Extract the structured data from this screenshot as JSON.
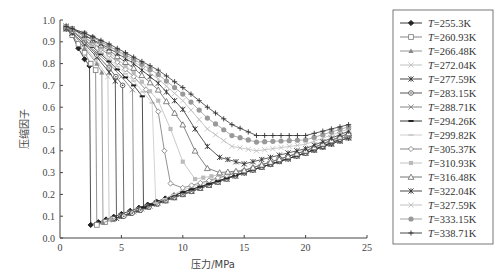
{
  "chart_data": {
    "type": "line",
    "title": "",
    "xlabel": "压力/MPa",
    "ylabel": "压缩因子",
    "xlim": [
      0,
      25
    ],
    "ylim": [
      0.0,
      1.0
    ],
    "xticks": [
      "0",
      "5",
      "10",
      "15",
      "20",
      "25"
    ],
    "yticks": [
      "0.0",
      "0.1",
      "0.2",
      "0.3",
      "0.4",
      "0.5",
      "0.6",
      "0.7",
      "0.8",
      "0.9",
      "1.0"
    ],
    "grid": false,
    "legend_position": "right-outside",
    "series": [
      {
        "name": "T=255.3K",
        "marker": "diamond-filled",
        "color": "#222222",
        "x": [
          0.5,
          1.0,
          1.5,
          2.0,
          2.4,
          2.5,
          5,
          10,
          15,
          20,
          23.5
        ],
        "y": [
          0.96,
          0.93,
          0.87,
          0.82,
          0.79,
          0.06,
          0.11,
          0.21,
          0.3,
          0.39,
          0.46
        ]
      },
      {
        "name": "T=260.93K",
        "marker": "square-open",
        "color": "#777777",
        "x": [
          0.5,
          1.0,
          1.5,
          2.0,
          2.5,
          2.9,
          3.0,
          5,
          10,
          15,
          20,
          23.5
        ],
        "y": [
          0.96,
          0.93,
          0.89,
          0.85,
          0.8,
          0.77,
          0.06,
          0.1,
          0.2,
          0.3,
          0.39,
          0.46
        ]
      },
      {
        "name": "T=266.48K",
        "marker": "triangle-filled",
        "color": "#888888",
        "x": [
          0.5,
          1.0,
          2.0,
          3.0,
          3.4,
          3.5,
          5,
          10,
          15,
          20,
          23.5
        ],
        "y": [
          0.96,
          0.94,
          0.87,
          0.8,
          0.76,
          0.07,
          0.1,
          0.2,
          0.3,
          0.39,
          0.46
        ]
      },
      {
        "name": "T=272.04K",
        "marker": "x-light",
        "color": "#bbbbbb",
        "x": [
          0.5,
          1.0,
          2.0,
          3.0,
          3.9,
          4.0,
          5,
          10,
          15,
          20,
          23.5
        ],
        "y": [
          0.96,
          0.94,
          0.88,
          0.81,
          0.74,
          0.08,
          0.1,
          0.2,
          0.3,
          0.39,
          0.46
        ]
      },
      {
        "name": "T=277.59K",
        "marker": "asterisk",
        "color": "#333333",
        "x": [
          0.5,
          1.0,
          2.0,
          3.0,
          4.0,
          4.5,
          4.6,
          5,
          10,
          15,
          20,
          23.5
        ],
        "y": [
          0.96,
          0.94,
          0.89,
          0.83,
          0.76,
          0.72,
          0.09,
          0.1,
          0.2,
          0.3,
          0.39,
          0.46
        ]
      },
      {
        "name": "T=283.15K",
        "marker": "circle-dot",
        "color": "#444444",
        "x": [
          0.5,
          1.0,
          2.0,
          3.0,
          4.0,
          5.1,
          5.2,
          10,
          15,
          20,
          23.5
        ],
        "y": [
          0.97,
          0.95,
          0.9,
          0.84,
          0.78,
          0.7,
          0.1,
          0.2,
          0.3,
          0.39,
          0.47
        ]
      },
      {
        "name": "T=288.71K",
        "marker": "x",
        "color": "#777777",
        "x": [
          0.5,
          1.0,
          2.0,
          3.0,
          4.0,
          5.0,
          5.9,
          6.0,
          10,
          15,
          20,
          23.5
        ],
        "y": [
          0.97,
          0.95,
          0.9,
          0.85,
          0.8,
          0.74,
          0.68,
          0.12,
          0.2,
          0.3,
          0.39,
          0.47
        ]
      },
      {
        "name": "T=294.26K",
        "marker": "dash-thick",
        "color": "#222222",
        "x": [
          0.5,
          1.0,
          2.0,
          4.0,
          6.0,
          6.7,
          6.8,
          10,
          15,
          20,
          23.5
        ],
        "y": [
          0.97,
          0.95,
          0.91,
          0.81,
          0.7,
          0.65,
          0.14,
          0.21,
          0.3,
          0.39,
          0.47
        ]
      },
      {
        "name": "T=299.82K",
        "marker": "dash-light",
        "color": "#c8c8c8",
        "x": [
          0.5,
          1.0,
          2.0,
          4.0,
          6.0,
          7.5,
          7.8,
          10,
          15,
          20,
          23.5
        ],
        "y": [
          0.97,
          0.95,
          0.91,
          0.82,
          0.72,
          0.62,
          0.16,
          0.22,
          0.31,
          0.4,
          0.47
        ]
      },
      {
        "name": "T=305.37K",
        "marker": "diamond-open",
        "color": "#777777",
        "x": [
          0.5,
          1.0,
          2.0,
          4.0,
          6.0,
          7.0,
          8.0,
          8.5,
          9.0,
          10,
          15,
          20,
          23.5
        ],
        "y": [
          0.97,
          0.96,
          0.92,
          0.84,
          0.74,
          0.68,
          0.58,
          0.4,
          0.25,
          0.23,
          0.31,
          0.4,
          0.48
        ]
      },
      {
        "name": "T=310.93K",
        "marker": "square-light",
        "color": "#bbbbbb",
        "x": [
          0.5,
          1.0,
          2.0,
          4.0,
          6.0,
          8.0,
          9.0,
          10,
          11,
          15,
          20,
          23.5
        ],
        "y": [
          0.97,
          0.96,
          0.92,
          0.85,
          0.76,
          0.63,
          0.5,
          0.35,
          0.27,
          0.31,
          0.4,
          0.48
        ]
      },
      {
        "name": "T=316.48K",
        "marker": "triangle-open",
        "color": "#666666",
        "x": [
          0.5,
          1.0,
          2.0,
          4.0,
          6.0,
          8.0,
          10,
          11,
          12,
          13,
          15,
          20,
          23.5
        ],
        "y": [
          0.97,
          0.96,
          0.93,
          0.86,
          0.78,
          0.68,
          0.52,
          0.4,
          0.32,
          0.3,
          0.31,
          0.4,
          0.48
        ]
      },
      {
        "name": "T=322.04K",
        "marker": "asterisk",
        "color": "#333333",
        "x": [
          0.5,
          1.0,
          2.0,
          4.0,
          6.0,
          8.0,
          10,
          11,
          12,
          13,
          15,
          20,
          23.5
        ],
        "y": [
          0.97,
          0.96,
          0.93,
          0.87,
          0.8,
          0.71,
          0.59,
          0.5,
          0.42,
          0.37,
          0.34,
          0.41,
          0.49
        ]
      },
      {
        "name": "T=327.59K",
        "marker": "x-light",
        "color": "#bbbbbb",
        "x": [
          0.5,
          1.0,
          2.0,
          4.0,
          6.0,
          8.0,
          10,
          12,
          14,
          16,
          20,
          23.5
        ],
        "y": [
          0.97,
          0.96,
          0.94,
          0.88,
          0.81,
          0.73,
          0.63,
          0.5,
          0.42,
          0.4,
          0.43,
          0.5
        ]
      },
      {
        "name": "T=333.15K",
        "marker": "circle-filled",
        "color": "#999999",
        "x": [
          0.5,
          1.0,
          2.0,
          4.0,
          6.0,
          8.0,
          10,
          12,
          14,
          16,
          20,
          23.5
        ],
        "y": [
          0.97,
          0.96,
          0.94,
          0.88,
          0.82,
          0.75,
          0.66,
          0.55,
          0.47,
          0.44,
          0.45,
          0.51
        ]
      },
      {
        "name": "T=338.71K",
        "marker": "plus",
        "color": "#333333",
        "x": [
          0.5,
          1.0,
          2.0,
          4.0,
          6.0,
          8.0,
          10,
          12,
          14,
          16,
          20,
          23.5
        ],
        "y": [
          0.97,
          0.96,
          0.94,
          0.89,
          0.83,
          0.77,
          0.69,
          0.6,
          0.52,
          0.47,
          0.47,
          0.52
        ]
      }
    ]
  },
  "axes": {
    "xlabel": "压力/MPa",
    "ylabel": "压缩因子",
    "origin_label": "0"
  },
  "legend": {
    "prefix": "T",
    "entries": [
      "=255.3K",
      "=260.93K",
      "=266.48K",
      "=272.04K",
      "=277.59K",
      "=283.15K",
      "=288.71K",
      "=294.26K",
      "=299.82K",
      "=305.37K",
      "=310.93K",
      "=316.48K",
      "=322.04K",
      "=327.59K",
      "=333.15K",
      "=338.71K"
    ]
  }
}
